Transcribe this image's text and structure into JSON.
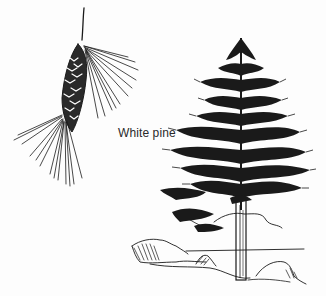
{
  "illustration": {
    "label": "White pine",
    "subjects": [
      "pine-cone-with-needles",
      "white-pine-tree"
    ],
    "ink_color": "#1a1a1a",
    "background_color": "#fdfdfd"
  }
}
